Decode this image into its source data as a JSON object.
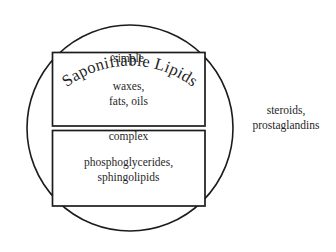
{
  "diagram": {
    "title": "Saponifiable Lipids",
    "type": "euler-classification-diagram",
    "circle": {
      "label": "Saponifiable Lipids",
      "label_style": "arc-text-along-top",
      "center_x": 130,
      "center_y": 128,
      "radius": 103
    },
    "boxes": [
      {
        "id": "simple",
        "heading": "simple",
        "items": [
          "waxes,",
          "fats, oils"
        ],
        "items_text": "waxes,\nfats, oils"
      },
      {
        "id": "complex",
        "heading": "complex",
        "items": [
          "phosphoglycerides,",
          "sphingolipids"
        ],
        "items_text": "phosphoglycerides,\nsphingolipids"
      }
    ],
    "outside_label": {
      "id": "unsaponifiable",
      "items": [
        "steroids,",
        "prostaglandins"
      ],
      "items_text": "steroids,\nprostaglandins"
    },
    "colors": {
      "stroke": "#1c1c1c",
      "text": "#1f1f1f",
      "background": "#ffffff"
    }
  }
}
